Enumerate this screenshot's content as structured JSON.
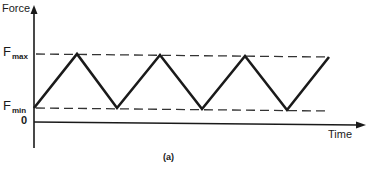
{
  "figure": {
    "y_axis_label": "Force",
    "x_axis_label": "Time",
    "levels": {
      "fmax": {
        "main": "F",
        "sub": "max"
      },
      "fmin": {
        "main": "F",
        "sub": "min"
      },
      "zero": "0"
    },
    "caption": "(a)",
    "waveform": "triangular (sawtooth-like) cyclic loading between Fmin and Fmax",
    "colors": {
      "line": "#1a1a1a",
      "dash": "#333333"
    }
  }
}
